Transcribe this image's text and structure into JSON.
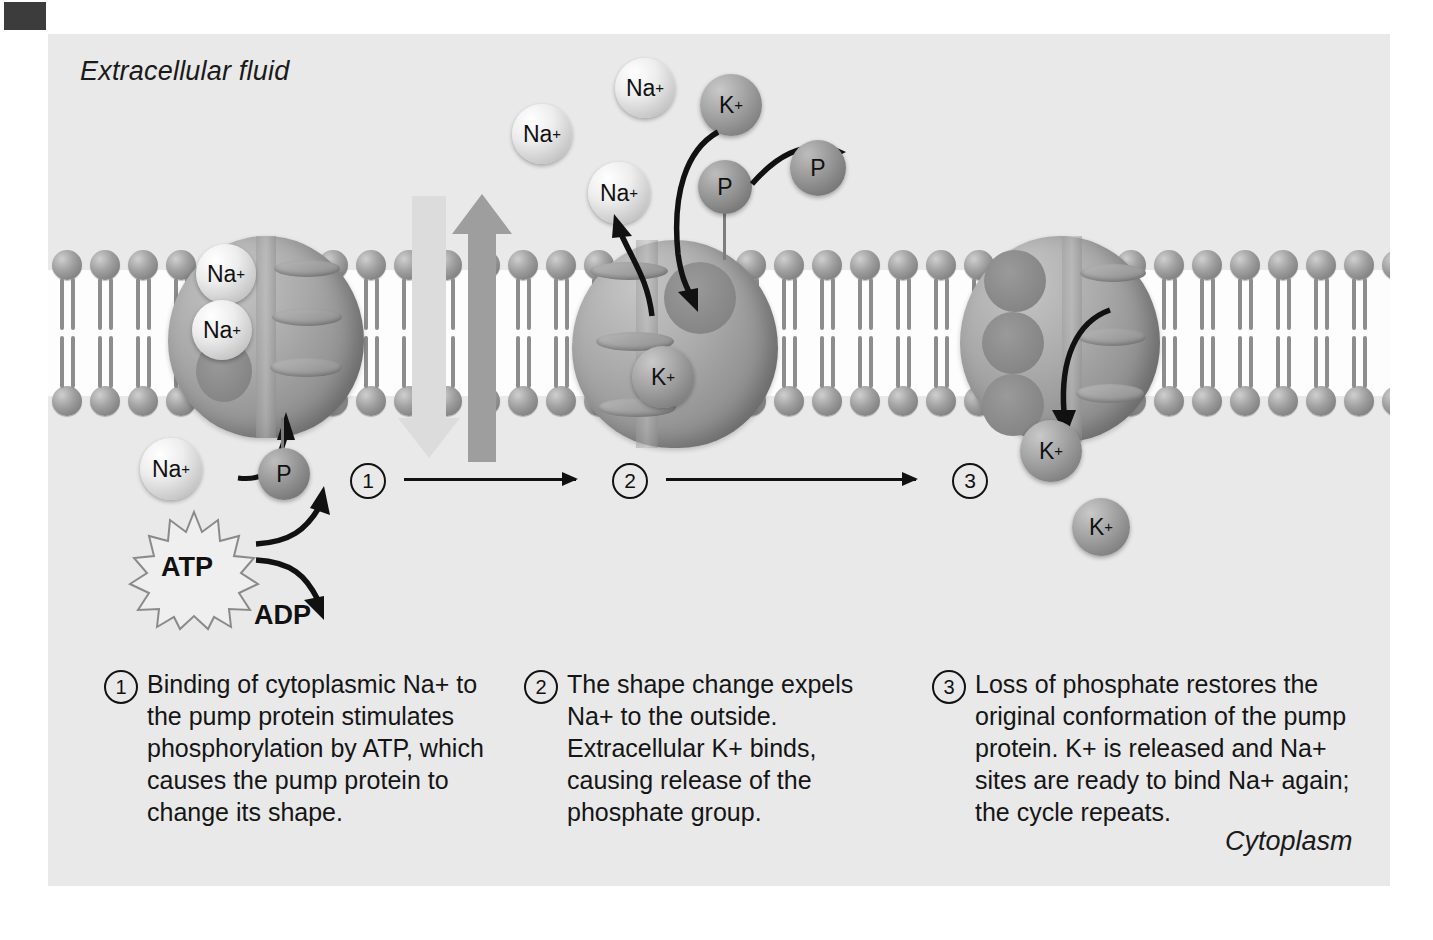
{
  "figure": {
    "compartment_top_label": "Extracellular fluid",
    "compartment_bottom_label": "Cytoplasm",
    "background_color": "#e9e9e9",
    "page_background": "#ffffff"
  },
  "energy": {
    "atp_label": "ATP",
    "adp_label": "ADP"
  },
  "steps": [
    {
      "number": "1",
      "text": "Binding of cytoplasmic Na+ to the pump protein stimulates phosphorylation by ATP, which causes the pump protein to change its shape."
    },
    {
      "number": "2",
      "text": "The shape change expels Na+ to the outside. Extracellular K+ binds, causing release of the phosphate group."
    },
    {
      "number": "3",
      "text": "Loss of phosphate restores the original conformation of the pump protein. K+ is released and Na+ sites are ready to bind Na+ again; the cycle repeats."
    }
  ],
  "step_markers": [
    "1",
    "2",
    "3"
  ],
  "ions": {
    "sodium_symbol": "Na",
    "potassium_symbol": "K",
    "charge": "+",
    "phosphate_symbol": "P"
  },
  "ion_instances": [
    {
      "id": "na-bound-1",
      "species": "Na",
      "location": "pump-1-interior"
    },
    {
      "id": "na-bound-2",
      "species": "Na",
      "location": "pump-1-interior"
    },
    {
      "id": "na-entering",
      "species": "Na",
      "location": "cytoplasm-below-pump-1"
    },
    {
      "id": "na-expelled-1",
      "species": "Na",
      "location": "extracellular-above-pump-2"
    },
    {
      "id": "na-expelled-2",
      "species": "Na",
      "location": "extracellular-above-pump-2"
    },
    {
      "id": "na-expelled-3",
      "species": "Na",
      "location": "extracellular-above-pump-2"
    },
    {
      "id": "k-incoming",
      "species": "K",
      "location": "extracellular-above-pump-2"
    },
    {
      "id": "k-bound",
      "species": "K",
      "location": "pump-2-interior"
    },
    {
      "id": "k-releasing",
      "species": "K",
      "location": "pump-3-lower-edge"
    },
    {
      "id": "k-released",
      "species": "K",
      "location": "cytoplasm-below-pump-3"
    },
    {
      "id": "p-attached-1",
      "species": "P",
      "location": "pump-1-stalk"
    },
    {
      "id": "p-attached-2",
      "species": "P",
      "location": "pump-2-stalk"
    },
    {
      "id": "p-free",
      "species": "P",
      "location": "extracellular-released"
    }
  ],
  "transport_arrows": [
    {
      "name": "potassium-influx-arrow",
      "direction": "down",
      "color": "#d8d8d8"
    },
    {
      "name": "sodium-efflux-arrow",
      "direction": "up",
      "color": "#9b9b9b"
    }
  ]
}
